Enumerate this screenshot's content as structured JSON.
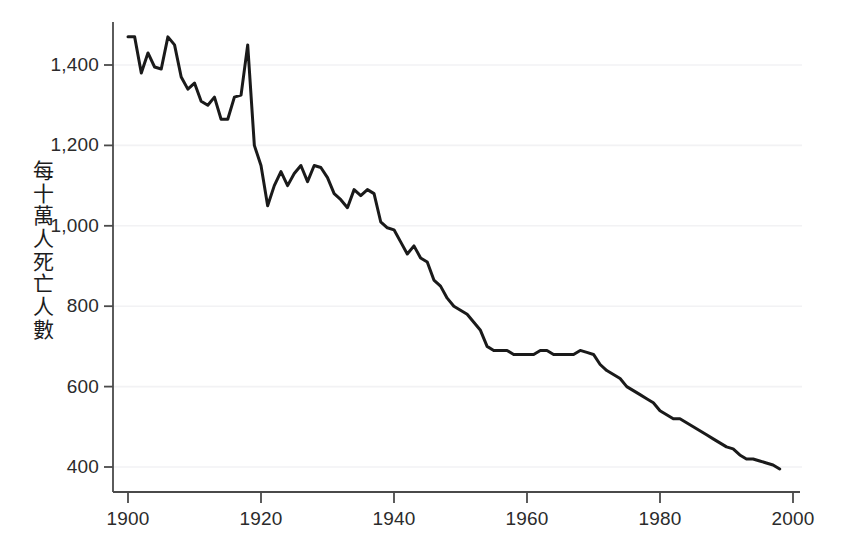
{
  "chart_data": {
    "type": "line",
    "title": "",
    "subtitle": "",
    "xlabel": "",
    "ylabel": "每十萬人死亡人數",
    "ylabel_chars": [
      "每",
      "十",
      "萬",
      "人",
      "死",
      "亡",
      "人",
      "數"
    ],
    "xlim": [
      1900,
      2000
    ],
    "ylim": [
      340,
      1520
    ],
    "grid": "faint horizontal gridlines at y ticks",
    "legend": "none",
    "line_color": "#1a1a1a",
    "line_width": 3,
    "background_color": "#ffffff",
    "axis_color": "#4a4a4a",
    "gridline_color": "#f2f2f4",
    "xticks": [
      1900,
      1920,
      1940,
      1960,
      1980,
      2000
    ],
    "xtick_labels": [
      "1900",
      "1920",
      "1940",
      "1960",
      "1980",
      "2000"
    ],
    "yticks": [
      400,
      600,
      800,
      1000,
      1200,
      1400
    ],
    "ytick_labels": [
      "400",
      "600",
      "800",
      "1,000",
      "1,200",
      "1,400"
    ],
    "x": [
      1900,
      1901,
      1902,
      1903,
      1904,
      1905,
      1906,
      1907,
      1908,
      1909,
      1910,
      1911,
      1912,
      1913,
      1914,
      1915,
      1916,
      1917,
      1918,
      1919,
      1920,
      1921,
      1922,
      1923,
      1924,
      1925,
      1926,
      1927,
      1928,
      1929,
      1930,
      1931,
      1932,
      1933,
      1934,
      1935,
      1936,
      1937,
      1938,
      1939,
      1940,
      1941,
      1942,
      1943,
      1944,
      1945,
      1946,
      1947,
      1948,
      1949,
      1950,
      1951,
      1952,
      1953,
      1954,
      1955,
      1956,
      1957,
      1958,
      1959,
      1960,
      1961,
      1962,
      1963,
      1964,
      1965,
      1966,
      1967,
      1968,
      1969,
      1970,
      1971,
      1972,
      1973,
      1974,
      1975,
      1976,
      1977,
      1978,
      1979,
      1980,
      1981,
      1982,
      1983,
      1984,
      1985,
      1986,
      1987,
      1988,
      1989,
      1990,
      1991,
      1992,
      1993,
      1994,
      1995,
      1996,
      1997,
      1998
    ],
    "y": [
      1470,
      1470,
      1380,
      1430,
      1395,
      1390,
      1470,
      1450,
      1370,
      1340,
      1355,
      1310,
      1300,
      1320,
      1265,
      1265,
      1320,
      1325,
      1450,
      1200,
      1150,
      1050,
      1100,
      1135,
      1100,
      1130,
      1150,
      1110,
      1150,
      1145,
      1120,
      1080,
      1065,
      1045,
      1090,
      1075,
      1090,
      1080,
      1010,
      995,
      990,
      960,
      930,
      950,
      920,
      910,
      865,
      850,
      820,
      800,
      790,
      780,
      760,
      740,
      700,
      690,
      690,
      690,
      680,
      680,
      680,
      680,
      690,
      690,
      680,
      680,
      680,
      680,
      690,
      685,
      680,
      655,
      640,
      630,
      620,
      600,
      590,
      580,
      570,
      560,
      540,
      530,
      520,
      520,
      510,
      500,
      490,
      480,
      470,
      460,
      450,
      445,
      430,
      420,
      420,
      415,
      410,
      405,
      395,
      380,
      375
    ],
    "annotations": [
      {
        "year": 1918,
        "value": 1450,
        "note": "1918 influenza pandemic spike"
      }
    ]
  }
}
